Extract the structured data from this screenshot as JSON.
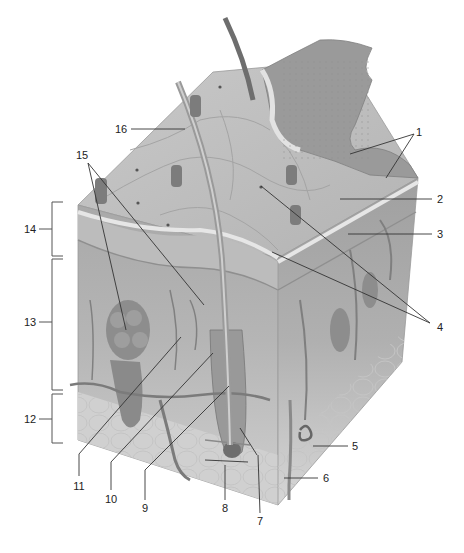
{
  "figure": {
    "type": "anatomical-diagram"
  },
  "labels": [
    {
      "id": "1",
      "text": "1",
      "x": 419,
      "y": 132
    },
    {
      "id": "2",
      "text": "2",
      "x": 440,
      "y": 199
    },
    {
      "id": "3",
      "text": "3",
      "x": 440,
      "y": 234
    },
    {
      "id": "4",
      "text": "4",
      "x": 440,
      "y": 327
    },
    {
      "id": "5",
      "text": "5",
      "x": 355,
      "y": 446
    },
    {
      "id": "6",
      "text": "6",
      "x": 326,
      "y": 478
    },
    {
      "id": "7",
      "text": "7",
      "x": 260,
      "y": 521
    },
    {
      "id": "8",
      "text": "8",
      "x": 225,
      "y": 508
    },
    {
      "id": "9",
      "text": "9",
      "x": 145,
      "y": 508
    },
    {
      "id": "10",
      "text": "10",
      "x": 111,
      "y": 499
    },
    {
      "id": "11",
      "text": "11",
      "x": 79,
      "y": 486
    },
    {
      "id": "12",
      "text": "12",
      "x": 30,
      "y": 419
    },
    {
      "id": "13",
      "text": "13",
      "x": 30,
      "y": 322
    },
    {
      "id": "14",
      "text": "14",
      "x": 30,
      "y": 229
    },
    {
      "id": "15",
      "text": "15",
      "x": 82,
      "y": 155
    },
    {
      "id": "16",
      "text": "16",
      "x": 121,
      "y": 129
    }
  ],
  "brackets": [
    {
      "label": "14",
      "top": 202,
      "bottom": 256
    },
    {
      "label": "13",
      "top": 259,
      "bottom": 390
    },
    {
      "label": "12",
      "top": 394,
      "bottom": 443
    }
  ],
  "colors": {
    "surface": "#bdbdbd",
    "epidermis": "#a8a8a8",
    "dermis": "#b4b4b4",
    "hypodermis": "#d2d2d2",
    "leader_line": "#333333",
    "label_text": "#222222"
  }
}
